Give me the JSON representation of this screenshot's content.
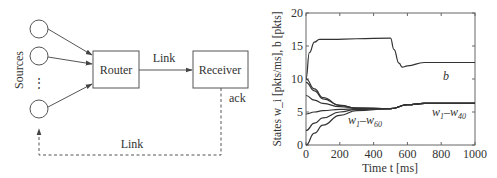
{
  "diagram": {
    "sources_label": "Sources",
    "ellipsis": "⋮",
    "router_label": "Router",
    "receiver_label": "Receiver",
    "forward_link_label": "Link",
    "feedback_link_label": "Link",
    "ack_label": "ack",
    "stroke_color": "#555555"
  },
  "chart_data": {
    "type": "line",
    "title": "",
    "xlabel": "Time t [ms]",
    "ylabel": "States w_i [pkts/ms], b [pkts]",
    "xlim": [
      0,
      1000
    ],
    "ylim": [
      0,
      20
    ],
    "x_ticks": [
      "0",
      "200",
      "400",
      "600",
      "800",
      "1000"
    ],
    "y_ticks": [
      "0",
      "5",
      "10",
      "15",
      "20"
    ],
    "grid": false,
    "annotations": [
      {
        "text": "b",
        "x": 820,
        "y": 10.2
      },
      {
        "text": "w1–w60",
        "x": 270,
        "y": 3.8
      },
      {
        "text": "w1–w40",
        "x": 760,
        "y": 4.8
      }
    ],
    "series": [
      {
        "name": "b (queue)",
        "x": [
          0,
          20,
          50,
          80,
          150,
          300,
          500,
          520,
          550,
          570,
          600,
          700,
          1000
        ],
        "values": [
          10,
          14,
          15.6,
          16,
          16,
          16.1,
          16.2,
          14.5,
          12.4,
          11.8,
          12,
          12.5,
          12.5
        ]
      },
      {
        "name": "w (from 10)",
        "x": [
          0,
          50,
          100,
          200,
          300,
          500,
          600,
          700,
          1000
        ],
        "values": [
          10,
          8.5,
          7.2,
          6,
          5.6,
          5.5,
          6.1,
          6.3,
          6.3
        ]
      },
      {
        "name": "w (from 9.5)",
        "x": [
          0,
          50,
          100,
          200,
          300,
          500,
          600,
          700,
          1000
        ],
        "values": [
          9.5,
          8.2,
          7.0,
          6,
          5.6,
          5.5,
          6.1,
          6.3,
          6.3
        ]
      },
      {
        "name": "w (from 7.5)",
        "x": [
          0,
          50,
          100,
          200,
          300,
          500,
          600,
          700,
          1000
        ],
        "values": [
          7.5,
          6.8,
          6.3,
          5.8,
          5.6,
          5.5,
          6.1,
          6.3,
          6.3
        ]
      },
      {
        "name": "w (from 4.7)",
        "x": [
          0,
          50,
          100,
          200,
          300,
          500,
          600,
          700,
          1000
        ],
        "values": [
          4.7,
          5.0,
          5.2,
          5.4,
          5.5,
          5.5,
          6.1,
          6.3,
          6.3
        ]
      },
      {
        "name": "w (from 2.2)",
        "x": [
          0,
          50,
          100,
          200,
          300,
          500,
          600,
          700,
          1000
        ],
        "values": [
          2.2,
          3.3,
          4.1,
          5.0,
          5.4,
          5.5,
          6.1,
          6.3,
          6.3
        ]
      },
      {
        "name": "w (from 0)",
        "x": [
          0,
          50,
          100,
          200,
          300,
          500,
          600,
          700,
          1000
        ],
        "values": [
          0,
          1.8,
          3.0,
          4.5,
          5.2,
          5.5,
          6.1,
          6.3,
          6.3
        ]
      }
    ]
  }
}
